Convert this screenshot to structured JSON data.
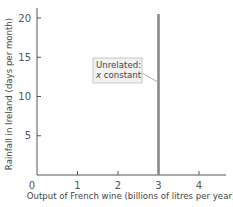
{
  "chart_data": {
    "type": "line",
    "title": "",
    "xlabel": "Output of French wine (billions of litres per year)",
    "ylabel": "Rainfall in Ireland (days per month)",
    "xlim": [
      0,
      4.8
    ],
    "ylim": [
      0,
      21
    ],
    "x_ticks": [
      0,
      1,
      2,
      3,
      4
    ],
    "x_tick_labels": [
      "0",
      "1",
      "2",
      "3",
      "4"
    ],
    "y_ticks": [
      5,
      10,
      15,
      20
    ],
    "y_tick_labels": [
      "5",
      "10",
      "15",
      "20"
    ],
    "grid": false,
    "legend": null,
    "series": [
      {
        "name": "Unrelated: x constant",
        "color": "#8a8a8a",
        "x": [
          3,
          3
        ],
        "y": [
          0,
          20.5
        ]
      }
    ],
    "annotations": [
      {
        "lines": [
          "Unrelated:",
          "x constant"
        ],
        "x_text": 1.6,
        "y_text": 13.5,
        "points_to": {
          "x": 3,
          "y": 11.8
        }
      }
    ]
  },
  "colors": {
    "axis": "#555555",
    "line": "#8a8a8a",
    "annotation_bg": "#f2f2f2",
    "annotation_border": "#bbbbbb"
  },
  "layout": {
    "origin_px": [
      37,
      175
    ],
    "x_unit_px": 40.5,
    "y_unit_px": 7.85,
    "x_axis_end_px": 226,
    "y_axis_top_px": 8
  }
}
